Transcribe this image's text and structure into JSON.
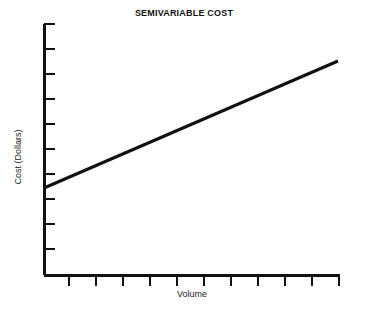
{
  "chart_data": {
    "type": "line",
    "title": "SEMIVARIABLE COST",
    "xlabel": "Volume",
    "ylabel": "Cost (Dollars)",
    "grid": false,
    "legend": null,
    "axis_color": "#111111",
    "line_color": "#111111",
    "background": "#ffffff",
    "xlim": [
      0,
      11
    ],
    "ylim": [
      0,
      10
    ],
    "x_tick_labels": [],
    "y_tick_labels": [],
    "x_tick_count": 11,
    "y_tick_count": 10,
    "series": [
      {
        "name": "Semivariable cost",
        "x": [
          0,
          11
        ],
        "values": [
          3.45,
          8.5
        ],
        "intercept": 3.45,
        "slope": 0.459,
        "line_width_px": 3
      }
    ],
    "annotations": []
  },
  "axis_geometry": {
    "origin_x": 44,
    "origin_y": 275,
    "y_axis_top": 24,
    "x_axis_right": 340,
    "y_tick_positions": [
      24,
      49,
      74,
      99,
      124,
      149,
      174,
      199,
      224,
      249
    ],
    "x_tick_positions": [
      69,
      96,
      123,
      150,
      177,
      204,
      231,
      258,
      285,
      312,
      339
    ],
    "tick_len": 11,
    "line_start": [
      44,
      188
    ],
    "line_end": [
      338,
      61
    ]
  }
}
